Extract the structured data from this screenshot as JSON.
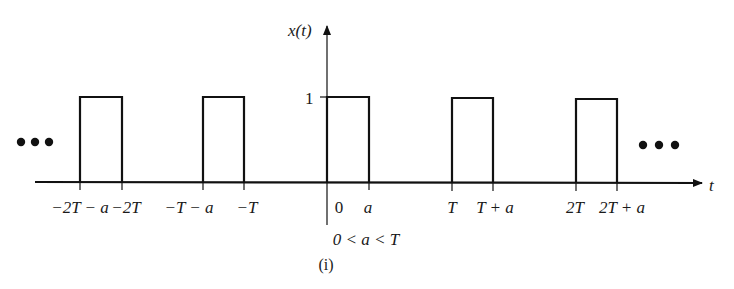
{
  "figure": {
    "y_axis_label": "x(t)",
    "x_axis_label": "t",
    "amplitude_label": "1",
    "constraint": "0 < a < T",
    "caption": "(i)",
    "continuation_left": "•••",
    "continuation_right": "•••"
  },
  "tick_labels": [
    {
      "key": "neg2T_minus_a",
      "text": "−2T − a",
      "x": 80
    },
    {
      "key": "neg2T",
      "text": "−2T",
      "x": 122
    },
    {
      "key": "negT_minus_a",
      "text": "−T − a",
      "x": 203
    },
    {
      "key": "negT",
      "text": "−T",
      "x": 244
    },
    {
      "key": "zero",
      "text": "0",
      "x": 327
    },
    {
      "key": "a",
      "text": "a",
      "x": 369
    },
    {
      "key": "T",
      "text": "T",
      "x": 452
    },
    {
      "key": "T_plus_a",
      "text": "T + a",
      "x": 493
    },
    {
      "key": "twoT",
      "text": "2T",
      "x": 576
    },
    {
      "key": "twoT_plus_a",
      "text": "2T + a",
      "x": 617
    }
  ],
  "labels": {
    "neg2T_minus_a": "−2T − a",
    "neg2T": "−2T",
    "negT_minus_a": "−T − a",
    "negT": "−T",
    "zero": "0",
    "a": "a",
    "T": "T",
    "T_plus_a": "T + a",
    "twoT": "2T",
    "twoT_plus_a": "2T + a"
  },
  "signal": {
    "type": "periodic rectangular pulse train",
    "amplitude": 1,
    "period": "T",
    "pulse_width": "a",
    "pulses": [
      {
        "start": "-2T-a",
        "end": "-2T"
      },
      {
        "start": "-T-a",
        "end": "-T"
      },
      {
        "start": "0",
        "end": "a"
      },
      {
        "start": "T",
        "end": "T+a"
      },
      {
        "start": "2T",
        "end": "2T+a"
      }
    ]
  },
  "colors": {
    "stroke": "#111111",
    "background": "#ffffff"
  }
}
